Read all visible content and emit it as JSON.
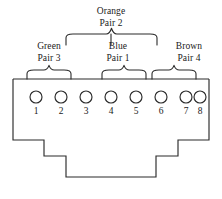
{
  "diagram": {
    "colors": {
      "line": "#2b2b2b",
      "text": "#1a1a1a",
      "background": "#ffffff"
    },
    "connector": {
      "name": "rj45-connector-body",
      "outline_points": "13,79 13,140 44,140 44,156 66,156 66,177 156,177 156,156 178,156 178,140 209,140 209,79",
      "top_edge": "13,79 209,79"
    },
    "pins": [
      {
        "number": "1",
        "cx": 36,
        "cy": 97
      },
      {
        "number": "2",
        "cx": 61,
        "cy": 97
      },
      {
        "number": "3",
        "cx": 86,
        "cy": 97
      },
      {
        "number": "4",
        "cx": 111,
        "cy": 97
      },
      {
        "number": "5",
        "cx": 136,
        "cy": 97
      },
      {
        "number": "6",
        "cx": 161,
        "cy": 97
      },
      {
        "number": "7",
        "cx": 186,
        "cy": 97
      },
      {
        "number": "8",
        "cx": 200,
        "cy": 97
      }
    ],
    "pin_geometry": {
      "radius": 6.0,
      "number_y": 114
    },
    "pairs": [
      {
        "id": "green-pair-3",
        "color_name": "Green",
        "pair_text": "Pair 3",
        "covers_pins": "1-2",
        "label_left": 18,
        "label_top": 41,
        "label_width": 62,
        "brace_left": 27,
        "brace_right": 71,
        "brace_bottom": 79,
        "brace_height": 9
      },
      {
        "id": "orange-pair-2",
        "color_name": "Orange",
        "pair_text": "Pair 2",
        "covers_pins": "3-6",
        "label_left": 80,
        "label_top": 6,
        "label_width": 62,
        "brace_left": 66,
        "brace_right": 157,
        "brace_bottom": 45,
        "brace_height": 11
      },
      {
        "id": "blue-pair-1",
        "color_name": "Blue",
        "pair_text": "Pair 1",
        "covers_pins": "4-5",
        "label_left": 92,
        "label_top": 41,
        "label_width": 52,
        "brace_left": 102,
        "brace_right": 146,
        "brace_bottom": 79,
        "brace_height": 9
      },
      {
        "id": "brown-pair-4",
        "color_name": "Brown",
        "pair_text": "Pair 4",
        "covers_pins": "7-8",
        "label_left": 158,
        "label_top": 41,
        "label_width": 62,
        "brace_left": 152,
        "brace_right": 196,
        "brace_bottom": 79,
        "brace_height": 9
      }
    ],
    "orange_stem": {
      "x": 111,
      "y_top": 34,
      "y_bottom": 45
    }
  }
}
